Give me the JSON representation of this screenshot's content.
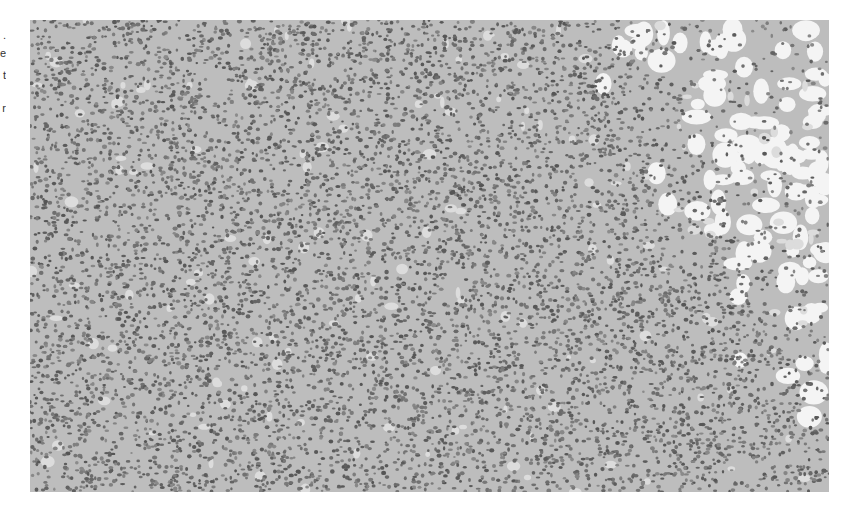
{
  "image": {
    "type": "micrograph",
    "stain": "grayscale histology",
    "description": "Dense sheets of round tumor cells with scattered clear spaces; adipose (fat) tissue with large empty vacuoles in the upper-right region",
    "colors": {
      "background": "#bdbdbd",
      "nuclei": "#6a6a6a",
      "fat_vacuoles": "#f4f4f4",
      "page": "#ffffff"
    }
  },
  "left_edge_fragments": [
    ".",
    "e",
    "t",
    "r"
  ]
}
